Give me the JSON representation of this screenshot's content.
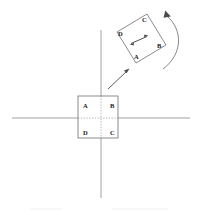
{
  "figure": {
    "background_color": "#ffffff",
    "line_color": "#6f6f6f",
    "axis_color": "#8a8a8a",
    "label_color": "#1a1a1a",
    "width": 197,
    "height": 215
  },
  "axes": {
    "horizontal": {
      "x1": 12,
      "y1": 118,
      "x2": 190,
      "y2": 118
    },
    "vertical": {
      "x1": 101,
      "y1": 30,
      "x2": 101,
      "y2": 198
    },
    "dotted_inside_shape": true
  },
  "original_square": {
    "name": "square-abcd-origin",
    "left": 78,
    "top": 96,
    "width": 40,
    "height": 42,
    "vertices": [
      {
        "id": "A",
        "label": "A",
        "position": "top-left",
        "x": 83,
        "y": 106
      },
      {
        "id": "B",
        "label": "B",
        "position": "top-right",
        "x": 110,
        "y": 106
      },
      {
        "id": "C",
        "label": "C",
        "position": "bottom-right",
        "x": 110,
        "y": 134
      },
      {
        "id": "D",
        "label": "D",
        "position": "bottom-left",
        "x": 83,
        "y": 134
      }
    ]
  },
  "rotated_square": {
    "name": "square-abcd-rotated",
    "rotation_degrees": -35,
    "corners": {
      "D": {
        "x": 117,
        "y": 32
      },
      "C": {
        "x": 147,
        "y": 14
      },
      "B": {
        "x": 165,
        "y": 45
      },
      "A": {
        "x": 135,
        "y": 63
      }
    },
    "vertices": [
      {
        "id": "D",
        "label": "D",
        "position": "left",
        "x": 119,
        "y": 35
      },
      {
        "id": "C",
        "label": "C",
        "position": "top",
        "x": 143,
        "y": 20
      },
      {
        "id": "B",
        "label": "B",
        "position": "right",
        "x": 158,
        "y": 48
      },
      {
        "id": "A",
        "label": "A",
        "position": "bottom",
        "x": 136,
        "y": 62
      }
    ],
    "inner_double_arrow": {
      "x1": 130,
      "y1": 44,
      "x2": 148,
      "y2": 36
    }
  },
  "translation_arrow": {
    "name": "translation-arrow",
    "from": {
      "x": 109,
      "y": 88
    },
    "to": {
      "x": 129,
      "y": 70
    },
    "direction": "up-right",
    "description": "straight arrow indicating translation of the square"
  },
  "rotation_arc": {
    "name": "rotation-arc-arrow",
    "direction": "counterclockwise",
    "arrowhead_at": {
      "x": 166,
      "y": 12
    },
    "description": "curved arc with arrowhead indicating rotation"
  },
  "legend": {
    "items": []
  }
}
